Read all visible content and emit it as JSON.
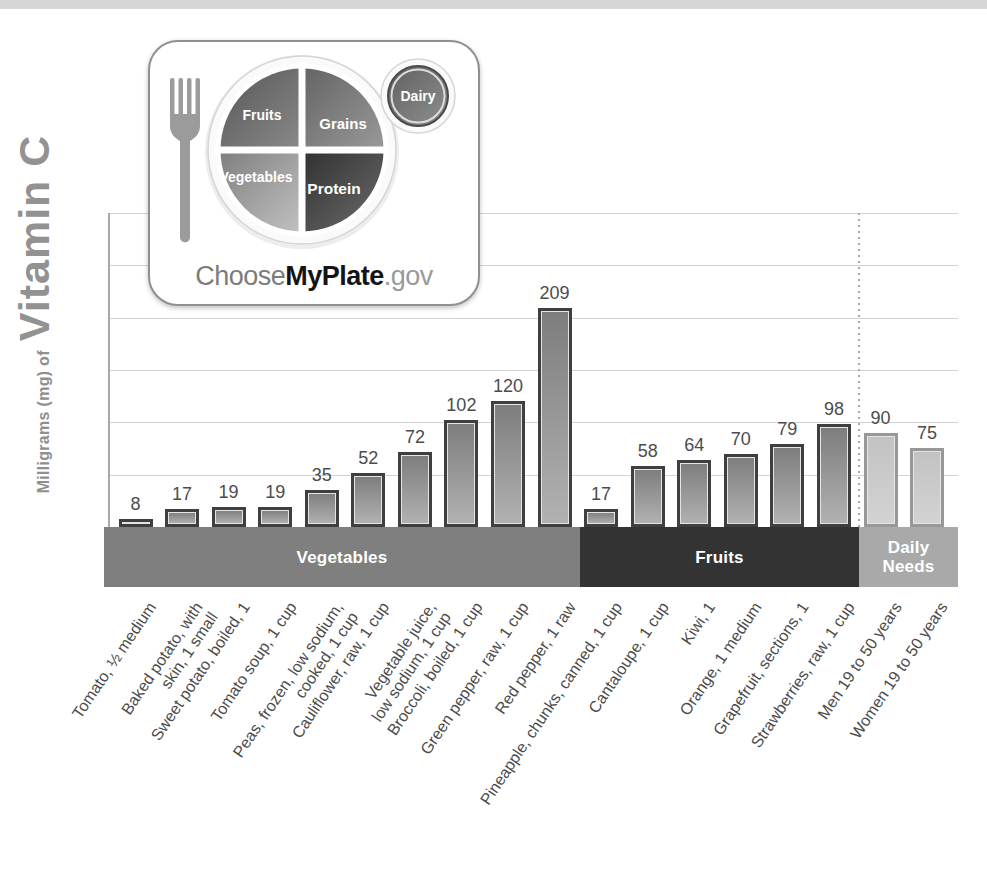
{
  "y_axis": {
    "unit_label": "Milligrams (mg) of",
    "nutrient_label": "Vitamin C"
  },
  "logo": {
    "fruits": "Fruits",
    "grains": "Grains",
    "vegetables": "Vegetables",
    "protein": "Protein",
    "dairy": "Dairy",
    "brand_choose": "Choose",
    "brand_myplate": "MyPlate",
    "brand_gov": ".gov"
  },
  "chart_data": {
    "type": "bar",
    "title": "",
    "xlabel": "",
    "ylabel": "Milligrams (mg) of Vitamin C",
    "ylim": [
      0,
      300
    ],
    "grid_step": 50,
    "grid": "horizontal, unlabeled ticks every 50 mg",
    "legend": "none",
    "categories": [
      "Tomato, ½ medium",
      "Baked potato, with\nskin, 1 small",
      "Sweet potato, boiled, 1",
      "Tomato soup, 1 cup",
      "Peas, frozen, low sodium,\ncooked, 1 cup",
      "Cauliflower, raw, 1 cup",
      "Vegetable juice,\nlow sodium, 1 cup",
      "Broccoli, boiled, 1 cup",
      "Green pepper, raw, 1 cup",
      "Red pepper, 1 raw",
      "Pineapple, chunks, canned, 1 cup",
      "Cantaloupe, 1 cup",
      "Kiwi, 1",
      "Orange, 1 medium",
      "Grapefruit, sections, 1",
      "Strawberries, raw, 1 cup",
      "Men 19 to 50 years",
      "Women 19 to 50 years"
    ],
    "values": [
      8,
      17,
      19,
      19,
      35,
      52,
      72,
      102,
      120,
      209,
      17,
      58,
      64,
      70,
      79,
      98,
      90,
      75
    ],
    "groups": [
      {
        "label": "Vegetables",
        "count": 10,
        "bar_style": "normal"
      },
      {
        "label": "Fruits",
        "count": 6,
        "bar_style": "normal"
      },
      {
        "label": "Daily\nNeeds",
        "count": 2,
        "bar_style": "light"
      }
    ]
  },
  "colors": {
    "top_strip": "#d6d6d6",
    "bar_border": "#3f3f3f",
    "bar_fill_top": "#7d7d7d",
    "bar_fill_bottom": "#b2b2b2",
    "bar_light_border": "#989898",
    "bar_light_fill_top": "#c2c2c2",
    "bar_light_fill_bottom": "#d3d3d3",
    "band_colors": [
      "#7f7f7f",
      "#333333",
      "#a9a9a9"
    ],
    "gridline": "#d2d2d2",
    "value_label_text": "#4c4c4c",
    "axis_text": "#8f8f8f"
  }
}
